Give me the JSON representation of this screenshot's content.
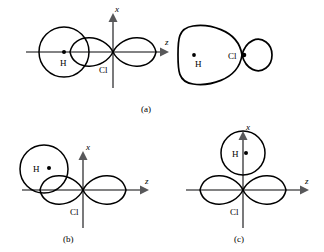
{
  "figure": {
    "colors": {
      "curve": "#000000",
      "axis": "#58585a",
      "background": "#ffffff"
    },
    "panels": [
      {
        "id": "a",
        "label": "(a)",
        "label_pos": {
          "x": 148,
          "y": 110
        },
        "description": "End-on overlap along z with resulting bonding molecular orbital",
        "axes": {
          "origin": {
            "x": 113,
            "y": 52
          },
          "z_label": "z",
          "z_label_pos": {
            "x": 168,
            "y": 45
          },
          "x_label": "x",
          "x_label_pos": {
            "x": 117,
            "y": 17
          }
        },
        "atoms": [
          {
            "symbol": "H",
            "label_pos": {
              "x": 63,
              "y": 63
            },
            "dot": {
              "x": 64,
              "y": 52
            }
          },
          {
            "symbol": "Cl",
            "label_pos": {
              "x": 100,
              "y": 71
            },
            "dot": null
          }
        ],
        "molecular_orbital": {
          "present": true,
          "atoms": [
            {
              "symbol": "H",
              "label_pos": {
                "x": 199,
                "y": 64
              },
              "dot": {
                "x": 194,
                "y": 55
              }
            },
            {
              "symbol": "Cl",
              "label_pos": {
                "x": 233,
                "y": 59
              },
              "dot": {
                "x": 247,
                "y": 55
              }
            }
          ]
        }
      },
      {
        "id": "b",
        "label": "(b)",
        "label_pos": {
          "x": 69,
          "y": 240
        },
        "description": "Oblique overlap, H 1s offset above the z axis",
        "axes": {
          "origin": {
            "x": 83,
            "y": 190
          },
          "z_label": "z",
          "z_label_pos": {
            "x": 148,
            "y": 185
          },
          "x_label": "x",
          "x_label_pos": {
            "x": 88,
            "y": 147
          }
        },
        "atoms": [
          {
            "symbol": "H",
            "label_pos": {
              "x": 35,
              "y": 170
            },
            "dot": {
              "x": 49,
              "y": 167
            }
          },
          {
            "symbol": "Cl",
            "label_pos": {
              "x": 71,
              "y": 213
            },
            "dot": null
          }
        ],
        "molecular_orbital": {
          "present": false,
          "atoms": []
        }
      },
      {
        "id": "c",
        "label": "(c)",
        "label_pos": {
          "x": 240,
          "y": 240
        },
        "description": "Side-on, zero net overlap: H 1s on the x axis above the Cl 3p node",
        "axes": {
          "origin": {
            "x": 243,
            "y": 190
          },
          "z_label": "z",
          "z_label_pos": {
            "x": 308,
            "y": 185
          },
          "x_label": "x",
          "x_label_pos": {
            "x": 248,
            "y": 136
          }
        },
        "atoms": [
          {
            "symbol": "H",
            "label_pos": {
              "x": 236,
              "y": 156
            },
            "dot": {
              "x": 245,
              "y": 153
            }
          },
          {
            "symbol": "Cl",
            "label_pos": {
              "x": 231,
              "y": 213
            },
            "dot": null
          }
        ],
        "molecular_orbital": {
          "present": false,
          "atoms": []
        }
      }
    ]
  }
}
